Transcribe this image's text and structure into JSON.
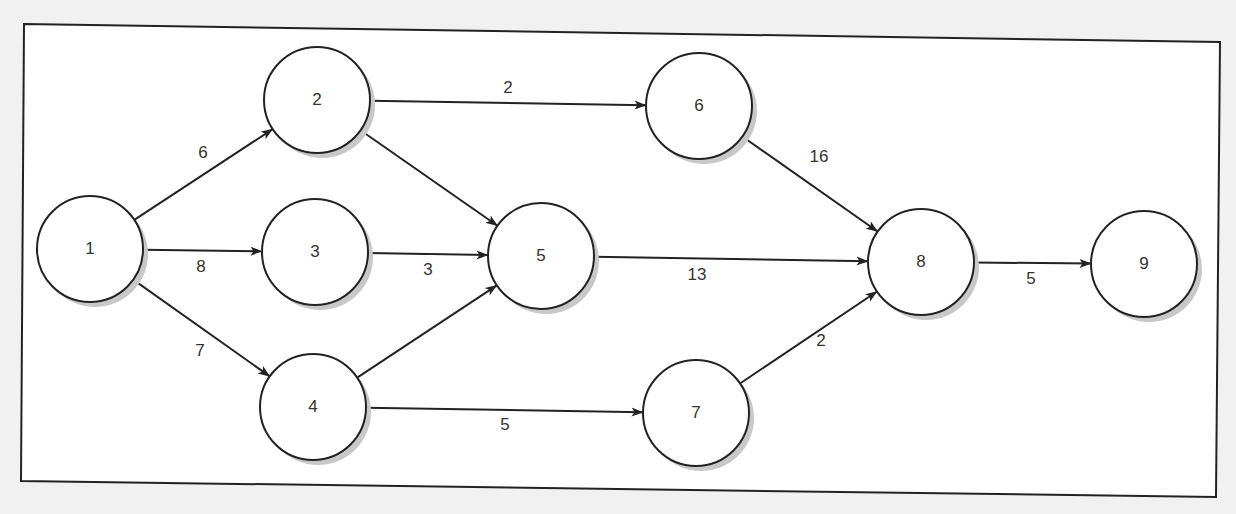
{
  "diagram": {
    "type": "network-diagram",
    "frame": {
      "x1": 24,
      "y1": 24,
      "x2": 1220,
      "y2": 42,
      "x3": 1216,
      "y3": 497,
      "x4": 21,
      "y4": 481
    },
    "style": {
      "background": "#f1f1f1",
      "frame_fill": "#ffffff",
      "stroke": "#222222",
      "shadow": "#c8c8c8",
      "text": "#333333"
    },
    "node_radius": 53,
    "nodes": [
      {
        "id": "1",
        "label": "1",
        "x": 90,
        "y": 249
      },
      {
        "id": "2",
        "label": "2",
        "x": 317,
        "y": 100
      },
      {
        "id": "3",
        "label": "3",
        "x": 315,
        "y": 252
      },
      {
        "id": "4",
        "label": "4",
        "x": 313,
        "y": 407
      },
      {
        "id": "5",
        "label": "5",
        "x": 541,
        "y": 256
      },
      {
        "id": "6",
        "label": "6",
        "x": 699,
        "y": 106
      },
      {
        "id": "7",
        "label": "7",
        "x": 696,
        "y": 413
      },
      {
        "id": "8",
        "label": "8",
        "x": 921,
        "y": 262
      },
      {
        "id": "9",
        "label": "9",
        "x": 1144,
        "y": 264
      }
    ],
    "edges": [
      {
        "from": "1",
        "to": "2",
        "weight": "6",
        "lx": 203,
        "ly": 154
      },
      {
        "from": "1",
        "to": "3",
        "weight": "8",
        "lx": 201,
        "ly": 268
      },
      {
        "from": "1",
        "to": "4",
        "weight": "7",
        "lx": 200,
        "ly": 352
      },
      {
        "from": "2",
        "to": "6",
        "weight": "2",
        "lx": 508,
        "ly": 89
      },
      {
        "from": "2",
        "to": "5",
        "weight": "",
        "lx": 0,
        "ly": 0
      },
      {
        "from": "3",
        "to": "5",
        "weight": "3",
        "lx": 428,
        "ly": 271
      },
      {
        "from": "4",
        "to": "5",
        "weight": "",
        "lx": 0,
        "ly": 0
      },
      {
        "from": "4",
        "to": "7",
        "weight": "5",
        "lx": 505,
        "ly": 426
      },
      {
        "from": "5",
        "to": "8",
        "weight": "13",
        "lx": 697,
        "ly": 276
      },
      {
        "from": "6",
        "to": "8",
        "weight": "16",
        "lx": 819,
        "ly": 158
      },
      {
        "from": "7",
        "to": "8",
        "weight": "2",
        "lx": 821,
        "ly": 342
      },
      {
        "from": "8",
        "to": "9",
        "weight": "5",
        "lx": 1031,
        "ly": 280
      }
    ]
  }
}
